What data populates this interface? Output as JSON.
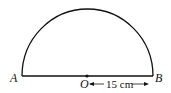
{
  "diagram": {
    "type": "semicircle",
    "points": {
      "A": "A",
      "B": "B",
      "O": "O"
    },
    "dimension": {
      "label": "15 cm",
      "from": "O",
      "to": "B",
      "meaning": "radius"
    },
    "colors": {
      "stroke": "#111111",
      "background": "#ffffff"
    }
  }
}
